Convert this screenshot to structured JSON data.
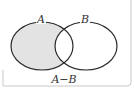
{
  "diagram": {
    "type": "venn",
    "sets": [
      {
        "label": "A",
        "cx": 42,
        "cy": 46,
        "rx": 31,
        "ry": 24
      },
      {
        "label": "B",
        "cx": 86,
        "cy": 46,
        "rx": 31,
        "ry": 24
      }
    ],
    "shaded_region": "A-B",
    "caption": "A−B",
    "colors": {
      "shade": "#e3e3e3",
      "stroke": "#2a2a2a",
      "frame": "#c8c8c8",
      "text": "#333333"
    }
  }
}
